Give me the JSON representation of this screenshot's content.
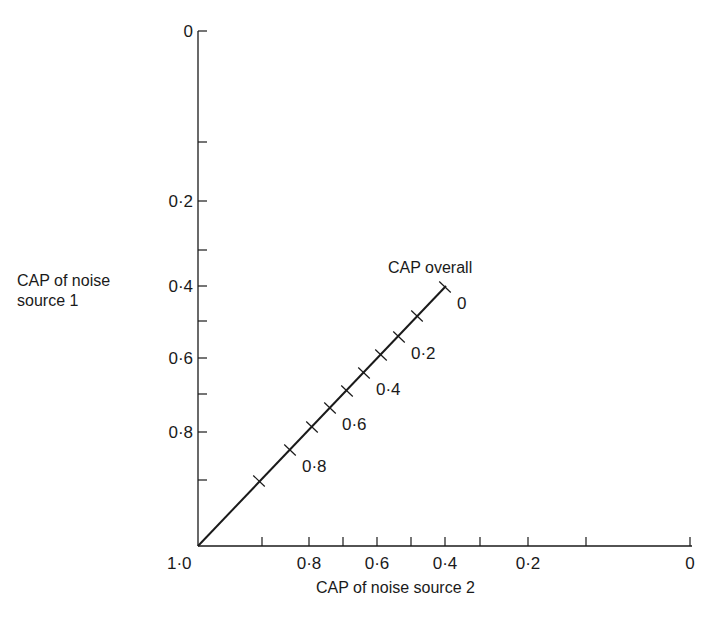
{
  "diagram": {
    "y_axis_label_line1": "CAP of noise",
    "y_axis_label_line2": "source 1",
    "x_axis_label": "CAP of noise source 2",
    "overall_line_label": "CAP overall",
    "origin_label": "1·0",
    "y_axis": {
      "ticks": [
        {
          "y": 31,
          "label": "0"
        },
        {
          "y": 142,
          "label": ""
        },
        {
          "y": 201,
          "label": "0·2"
        },
        {
          "y": 250,
          "label": ""
        },
        {
          "y": 286,
          "label": "0·4"
        },
        {
          "y": 321,
          "label": ""
        },
        {
          "y": 358,
          "label": "0·6"
        },
        {
          "y": 394,
          "label": ""
        },
        {
          "y": 432,
          "label": "0·8"
        },
        {
          "y": 480,
          "label": ""
        }
      ]
    },
    "x_axis": {
      "ticks": [
        {
          "x": 262,
          "label": ""
        },
        {
          "x": 309,
          "label": "0·8"
        },
        {
          "x": 343,
          "label": ""
        },
        {
          "x": 377,
          "label": "0·6"
        },
        {
          "x": 411,
          "label": ""
        },
        {
          "x": 445,
          "label": "0·4"
        },
        {
          "x": 480,
          "label": ""
        },
        {
          "x": 528,
          "label": "0·2"
        },
        {
          "x": 586,
          "label": ""
        },
        {
          "x": 690,
          "label": "0"
        }
      ]
    },
    "overall_scale": {
      "ticks": [
        {
          "x": 445,
          "y": 287,
          "label": "0"
        },
        {
          "x": 417,
          "y": 316,
          "label": ""
        },
        {
          "x": 399,
          "y": 337,
          "label": "0·2"
        },
        {
          "x": 381,
          "y": 355,
          "label": ""
        },
        {
          "x": 364,
          "y": 373,
          "label": "0·4"
        },
        {
          "x": 347,
          "y": 391,
          "label": ""
        },
        {
          "x": 330,
          "y": 408,
          "label": "0·6"
        },
        {
          "x": 312,
          "y": 427,
          "label": ""
        },
        {
          "x": 290,
          "y": 450,
          "label": "0·8"
        },
        {
          "x": 259,
          "y": 481,
          "label": ""
        }
      ]
    }
  },
  "chart_data": {
    "type": "line",
    "title": "",
    "xlabel": "CAP of noise source 2",
    "ylabel": "CAP of noise source 1",
    "x_ticks": [
      "1·0",
      "0·8",
      "0·6",
      "0·4",
      "0·2",
      "0"
    ],
    "y_ticks": [
      "0",
      "0·2",
      "0·4",
      "0·6",
      "0·8",
      "1·0"
    ],
    "xlim": [
      1.0,
      0
    ],
    "ylim": [
      1.0,
      0
    ],
    "series": [
      {
        "name": "CAP overall",
        "x": [
          1.0,
          0.4
        ],
        "y": [
          1.0,
          0.4
        ],
        "scale_labels": [
          "0",
          "0·2",
          "0·4",
          "0·6",
          "0·8"
        ]
      }
    ],
    "grid": false
  }
}
